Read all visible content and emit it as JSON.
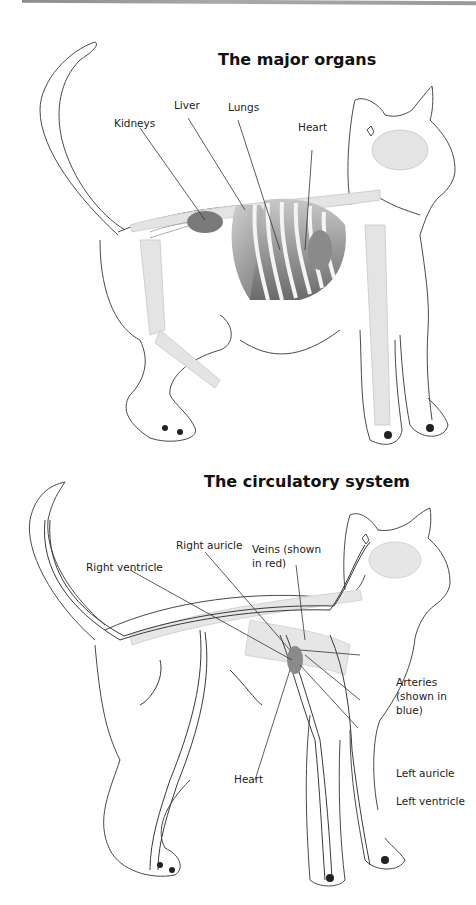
{
  "page": {
    "top_rule": true
  },
  "organs_diagram": {
    "title": "The major organs",
    "labels": {
      "kidneys": "Kidneys",
      "liver": "Liver",
      "lungs": "Lungs",
      "heart": "Heart"
    },
    "colors": {
      "outline": "#4a4a4a",
      "skeleton": "#d9d9d9",
      "organ_dark": "#6e6e6e",
      "organ_light": "#b5b5b5"
    }
  },
  "circulatory_diagram": {
    "title": "The circulatory system",
    "labels": {
      "right_auricle": "Right auricle",
      "veins": "Veins (shown in red)",
      "right_ventricle": "Right ventricle",
      "arteries": "Arteries (shown in blue)",
      "heart": "Heart",
      "left_auricle": "Left auricle",
      "left_ventricle": "Left ventricle"
    },
    "colors": {
      "outline": "#4a4a4a",
      "vessel": "#3a3a3a",
      "skeleton": "#dcdcdc",
      "heart": "#8a8a8a"
    }
  }
}
